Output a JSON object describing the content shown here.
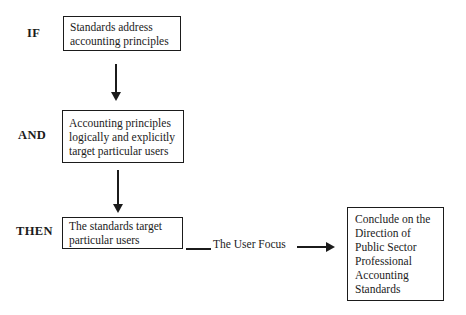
{
  "diagram": {
    "labels": {
      "if": "IF",
      "and": "AND",
      "then": "THEN"
    },
    "boxes": {
      "if_box": "Standards address\naccounting principles",
      "and_box": "Accounting principles\nlogically and explicitly\ntarget particular users",
      "then_box": "The standards target\nparticular users",
      "conclusion_box": "Conclude on the\nDirection of\nPublic Sector\nProfessional\nAccounting\nStandards"
    },
    "connector_label": "The User Focus",
    "colors": {
      "background": "#ffffff",
      "line": "#1b1b1b",
      "text": "#1b1b1b"
    }
  }
}
